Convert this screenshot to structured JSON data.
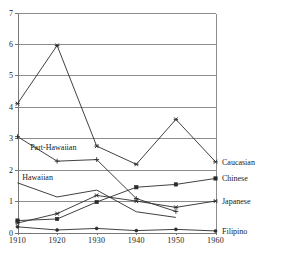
{
  "chart_data": {
    "type": "line",
    "title": "",
    "subtitle": "",
    "xlabel": "",
    "ylabel": "",
    "x": [
      1910,
      1920,
      1930,
      1940,
      1950,
      1960
    ],
    "xtick_labels": [
      "1910",
      "1920",
      "1930",
      "1940",
      "1950",
      "1960"
    ],
    "ytick_labels": [
      "0",
      "1",
      "2",
      "3",
      "4",
      "5",
      "6",
      "7"
    ],
    "yticks": [
      0,
      1,
      2,
      3,
      4,
      5,
      6,
      7
    ],
    "xlim": [
      1910,
      1960
    ],
    "ylim": [
      0,
      7
    ],
    "grid": "horizontal",
    "legend_position": "right-of-axes-inline",
    "series": [
      {
        "name": "Caucasian",
        "label_position": "right",
        "marker": "star",
        "values": [
          4.1,
          5.95,
          2.75,
          2.17,
          3.6,
          2.25
        ]
      },
      {
        "name": "Part-Hawaiian",
        "label_position": "inside",
        "marker": "plus",
        "values": [
          3.05,
          2.27,
          2.32,
          1.08,
          0.67,
          null
        ]
      },
      {
        "name": "Hawaiian",
        "label_position": "inside",
        "marker": "none",
        "values": [
          1.58,
          1.13,
          1.35,
          0.66,
          0.48,
          null
        ]
      },
      {
        "name": "Chinese",
        "label_position": "right",
        "marker": "square",
        "values": [
          0.38,
          0.43,
          0.97,
          1.44,
          1.53,
          1.72
        ]
      },
      {
        "name": "Japanese",
        "label_position": "right",
        "marker": "star",
        "values": [
          0.3,
          0.6,
          1.18,
          1.0,
          0.8,
          1.0
        ]
      },
      {
        "name": "Filipino",
        "label_position": "right",
        "marker": "dot",
        "values": [
          0.18,
          0.08,
          0.13,
          0.06,
          0.1,
          0.05
        ]
      }
    ],
    "inline_annotations": [
      {
        "text": "Part-Hawaiian",
        "x": 1913.2,
        "y": 2.72
      },
      {
        "text": "Hawaiian",
        "x": 1911.2,
        "y": 1.78
      }
    ],
    "right_labels": [
      {
        "text": "Caucasian",
        "y": 2.25
      },
      {
        "text": "Chinese",
        "y": 1.72
      },
      {
        "text": "Japanese",
        "y": 1.0
      },
      {
        "text": "Filipino",
        "y": 0.05
      }
    ],
    "colors": {
      "line": "#2b2b2b",
      "grid": "#8c8c8c",
      "axis": "#777777",
      "text": "#1a1a1a",
      "background": "#ffffff"
    }
  }
}
